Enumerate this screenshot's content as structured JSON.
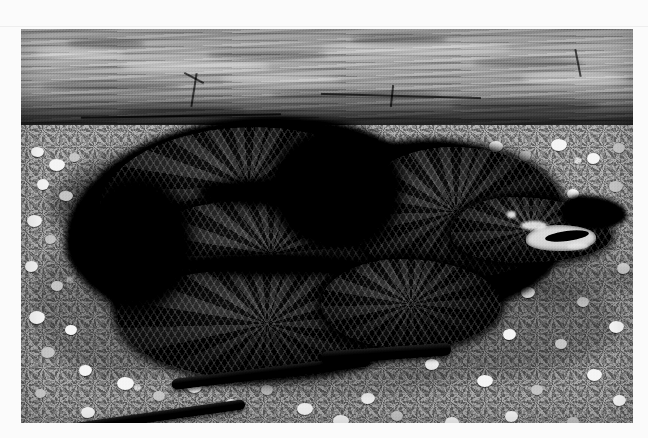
{
  "page": {
    "background_color": "#fbfbfb",
    "width": 648,
    "height": 438
  },
  "photo": {
    "name": "black-rat-snake-photograph",
    "alt_text": "Black rat snake coiled on gravel in front of a weathered wooden plank, head raised to the right with mouth open",
    "frame": {
      "x": 21,
      "y": 29,
      "width": 612,
      "height": 394
    },
    "style": "black-and-white photograph",
    "colors": {
      "wood_light": "#a6a6a6",
      "wood_mid": "#8e8e8e",
      "wood_dark": "#5a5a5a",
      "gravel_base": "#8a8a8a",
      "pebble_highlight": "#e8e8e8",
      "snake_body": "#0a0a0a",
      "snake_scale_highlight": "#3a3a3a",
      "mouth_interior": "#cfcfcf"
    },
    "regions": [
      {
        "name": "wood-plank",
        "description": "horizontal weathered board spanning the top of the frame, grain running left to right"
      },
      {
        "name": "gravel-ground",
        "description": "coarse pale gravel and pebbles covering the lower two thirds"
      },
      {
        "name": "snake-coils",
        "description": "large dark coiled body occupying the left and center"
      },
      {
        "name": "snake-head",
        "description": "head at right with mouth gaping open"
      },
      {
        "name": "snake-tail",
        "description": "thin tail sweeping to the lower-left corner"
      },
      {
        "name": "cast-shadow",
        "description": "dark shadow pooled beneath and behind the snake"
      }
    ]
  }
}
